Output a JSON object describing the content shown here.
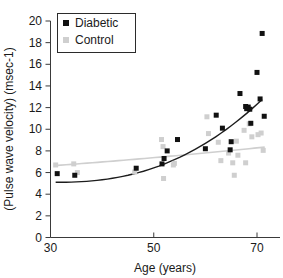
{
  "chart_data": {
    "type": "scatter",
    "title": "",
    "xlabel": "Age (years)",
    "ylabel": "(Pulse wave velocity) (msec-1)",
    "xlim": [
      30,
      72.5
    ],
    "ylim": [
      0,
      20
    ],
    "xticks": [
      30,
      50,
      70
    ],
    "yticks": [
      0,
      2,
      4,
      6,
      8,
      10,
      12,
      14,
      16,
      18,
      20
    ],
    "xtick_labels": [
      "30",
      "50",
      "70"
    ],
    "ytick_labels": [
      "0",
      "2",
      "4",
      "6",
      "8",
      "10",
      "12",
      "14",
      "16",
      "18",
      "20"
    ],
    "grid": false,
    "legend_position": "top-left-inside",
    "colors": {
      "diabetic": "#111111",
      "control": "#cfcfcf",
      "axis": "#3a3a3a",
      "text": "#1a1a1a",
      "background": "#ffffff"
    },
    "series": [
      {
        "name": "Diabetic",
        "marker": "square",
        "color": "#111111",
        "points": [
          [
            31.3,
            5.9
          ],
          [
            34.7,
            5.75
          ],
          [
            46.6,
            6.4
          ],
          [
            51.6,
            6.8
          ],
          [
            52.0,
            7.3
          ],
          [
            52.6,
            8.0
          ],
          [
            54.6,
            9.05
          ],
          [
            60.0,
            8.2
          ],
          [
            62.1,
            11.3
          ],
          [
            63.3,
            10.1
          ],
          [
            64.8,
            8.1
          ],
          [
            65.0,
            8.85
          ],
          [
            66.7,
            13.3
          ],
          [
            67.8,
            12.1
          ],
          [
            68.0,
            11.9
          ],
          [
            68.3,
            12.05
          ],
          [
            68.6,
            11.85
          ],
          [
            68.8,
            10.55
          ],
          [
            70.0,
            15.25
          ],
          [
            70.6,
            12.8
          ],
          [
            71.0,
            18.85
          ],
          [
            71.4,
            11.2
          ]
        ]
      },
      {
        "name": "Control",
        "marker": "square",
        "color": "#cfcfcf",
        "points": [
          [
            31.0,
            6.7
          ],
          [
            34.5,
            6.8
          ],
          [
            35.2,
            6.0
          ],
          [
            46.3,
            6.05
          ],
          [
            51.5,
            9.05
          ],
          [
            51.8,
            8.4
          ],
          [
            51.9,
            5.45
          ],
          [
            53.8,
            6.7
          ],
          [
            54.0,
            6.85
          ],
          [
            60.3,
            11.15
          ],
          [
            60.6,
            9.6
          ],
          [
            62.5,
            8.8
          ],
          [
            63.0,
            7.1
          ],
          [
            64.5,
            7.8
          ],
          [
            65.3,
            6.9
          ],
          [
            65.6,
            5.75
          ],
          [
            66.0,
            8.9
          ],
          [
            66.3,
            7.6
          ],
          [
            67.5,
            9.9
          ],
          [
            67.8,
            6.9
          ],
          [
            68.5,
            10.5
          ],
          [
            69.0,
            9.3
          ],
          [
            70.2,
            9.5
          ],
          [
            70.8,
            9.65
          ],
          [
            71.2,
            8.05
          ]
        ]
      }
    ],
    "fits": [
      {
        "name": "Diabetic trend",
        "color": "#1c1c1c",
        "style": "exponential-rising",
        "x_range": [
          31.0,
          71.0
        ],
        "y_range": [
          5.1,
          12.75
        ]
      },
      {
        "name": "Control trend",
        "color": "#cfcfcf",
        "style": "near-linear-flat",
        "x_range": [
          31.0,
          71.5
        ],
        "y_range": [
          6.65,
          8.35
        ]
      }
    ],
    "legend": [
      {
        "label": "Diabetic",
        "color": "#111111"
      },
      {
        "label": "Control",
        "color": "#cfcfcf"
      }
    ]
  }
}
